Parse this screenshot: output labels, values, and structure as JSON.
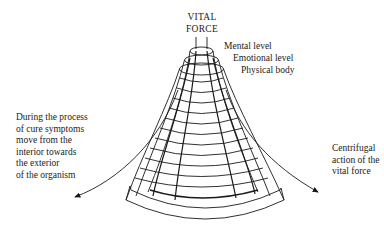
{
  "diagram": {
    "apex_label": [
      "VITAL",
      "FORCE"
    ],
    "levels": [
      {
        "label": "Mental level"
      },
      {
        "label": "Emotional level"
      },
      {
        "label": "Physical body"
      }
    ],
    "left_annotation": [
      "During the process",
      "of cure symptoms",
      "move from the",
      "interior towards",
      "the exterior",
      "of the organism"
    ],
    "right_annotation": [
      "Centrifugal",
      "action of the",
      "vital force"
    ],
    "colors": {
      "ink": "#1a1a1a",
      "background": "#ffffff"
    }
  }
}
